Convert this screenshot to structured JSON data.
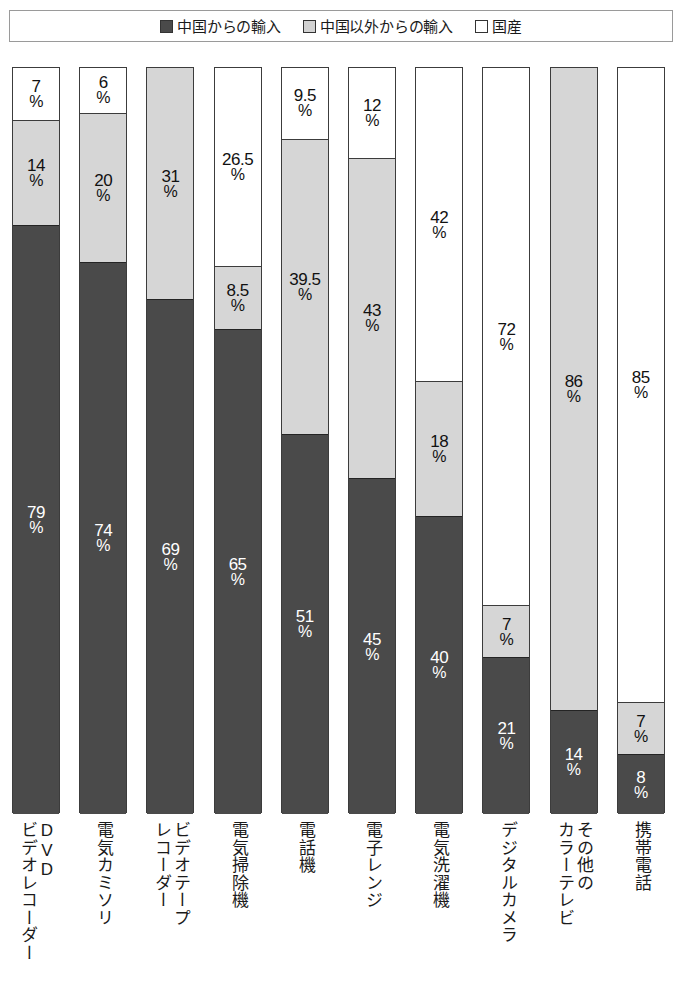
{
  "legend": {
    "items": [
      {
        "label": "中国からの輸入",
        "swatch": "dark-square-icon",
        "color": "#4a4a4a"
      },
      {
        "label": "中国以外からの輸入",
        "swatch": "gray-square-icon",
        "color": "#d2d2d2"
      },
      {
        "label": "国産",
        "swatch": "white-square-icon",
        "color": "#ffffff"
      }
    ]
  },
  "chart_data": {
    "type": "bar",
    "stacked": true,
    "orientation": "vertical",
    "stack_order_top_to_bottom": [
      "国産",
      "中国以外からの輸入",
      "中国からの輸入"
    ],
    "title": "",
    "xlabel": "",
    "ylabel": "",
    "ylim": [
      0,
      100
    ],
    "grid": false,
    "legend_position": "top",
    "unit": "%",
    "categories": [
      "DVDビデオレコーダー",
      "電気カミソリ",
      "ビデオテープレコーダー",
      "電気掃除機",
      "電話機",
      "電子レンジ",
      "電気洗濯機",
      "デジタルカメラ",
      "その他のカラーテレビ",
      "携帯電話"
    ],
    "category_lines": [
      [
        "DVD",
        "ビデオレコーダー"
      ],
      [
        "電気カミソリ"
      ],
      [
        "ビデオテープ",
        "レコーダー"
      ],
      [
        "電気掃除機"
      ],
      [
        "電話機"
      ],
      [
        "電子レンジ"
      ],
      [
        "電気洗濯機"
      ],
      [
        "デジタルカメラ"
      ],
      [
        "その他の",
        "カラーテレビ"
      ],
      [
        "携帯電話"
      ]
    ],
    "series": [
      {
        "name": "国産",
        "key": "domestic",
        "color": "#ffffff",
        "values": [
          7,
          6,
          0,
          26.5,
          9.5,
          12,
          42,
          72,
          0,
          85
        ]
      },
      {
        "name": "中国以外からの輸入",
        "key": "other",
        "color": "#d6d6d6",
        "values": [
          14,
          20,
          31,
          8.5,
          39.5,
          43,
          18,
          7,
          86,
          7
        ]
      },
      {
        "name": "中国からの輸入",
        "key": "china",
        "color": "#4a4a4a",
        "values": [
          79,
          74,
          69,
          65,
          51,
          45,
          40,
          21,
          14,
          8
        ]
      }
    ],
    "bars": [
      {
        "category": "DVDビデオレコーダー",
        "domestic": 7,
        "domestic_label": "7",
        "other": 14,
        "other_label": "14",
        "china": 79,
        "china_label": "79"
      },
      {
        "category": "電気カミソリ",
        "domestic": 6,
        "domestic_label": "6",
        "other": 20,
        "other_label": "20",
        "china": 74,
        "china_label": "74"
      },
      {
        "category": "ビデオテープレコーダー",
        "domestic": 0,
        "domestic_label": "",
        "other": 31,
        "other_label": "31",
        "china": 69,
        "china_label": "69"
      },
      {
        "category": "電気掃除機",
        "domestic": 26.5,
        "domestic_label": "26.5",
        "other": 8.5,
        "other_label": "8.5",
        "china": 65,
        "china_label": "65"
      },
      {
        "category": "電話機",
        "domestic": 9.5,
        "domestic_label": "9.5",
        "other": 39.5,
        "other_label": "39.5",
        "china": 51,
        "china_label": "51"
      },
      {
        "category": "電子レンジ",
        "domestic": 12,
        "domestic_label": "12",
        "other": 43,
        "other_label": "43",
        "china": 45,
        "china_label": "45"
      },
      {
        "category": "電気洗濯機",
        "domestic": 42,
        "domestic_label": "42",
        "other": 18,
        "other_label": "18",
        "china": 40,
        "china_label": "40"
      },
      {
        "category": "デジタルカメラ",
        "domestic": 72,
        "domestic_label": "72",
        "other": 7,
        "other_label": "7",
        "china": 21,
        "china_label": "21"
      },
      {
        "category": "その他のカラーテレビ",
        "domestic": 0,
        "domestic_label": "",
        "other": 86,
        "other_label": "86",
        "china": 14,
        "china_label": "14"
      },
      {
        "category": "携帯電話",
        "domestic": 85,
        "domestic_label": "85",
        "other": 7,
        "other_label": "7",
        "china": 8,
        "china_label": "8"
      }
    ]
  },
  "layout": {
    "plot_left": 12,
    "plot_top": 67,
    "plot_height": 746,
    "bar_width": 48,
    "bar_pitch": 67.2
  }
}
